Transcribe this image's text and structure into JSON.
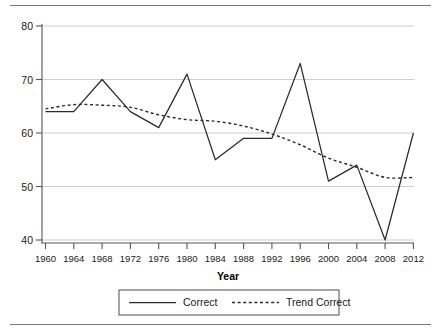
{
  "chart_data": {
    "type": "line",
    "title": "",
    "xlabel": "Year",
    "ylabel": "",
    "xlim": [
      1960,
      2012
    ],
    "ylim": [
      38.5,
      81
    ],
    "grid": true,
    "grid_axis": "y",
    "legend_position": "bottom",
    "x": [
      1960,
      1964,
      1968,
      1972,
      1976,
      1980,
      1984,
      1988,
      1992,
      1996,
      2000,
      2004,
      2008,
      2012
    ],
    "xtick_labels": [
      "1960",
      "1964",
      "1968",
      "1972",
      "1976",
      "1980",
      "1984",
      "1988",
      "1992",
      "1996",
      "2000",
      "2004",
      "2008",
      "2012"
    ],
    "ytick_labels": [
      "40",
      "50",
      "60",
      "70",
      "80"
    ],
    "yticks": [
      40,
      50,
      60,
      70,
      80
    ],
    "series": [
      {
        "name": "Correct",
        "style": "solid",
        "color": "#2b2b2b",
        "values": [
          64,
          64,
          70,
          64,
          61,
          71,
          55,
          59,
          59,
          73,
          51,
          54,
          40,
          60
        ]
      },
      {
        "name": "Trend Correct",
        "style": "dashed",
        "color": "#2b2b2b",
        "values": [
          64.5,
          65.3,
          65.2,
          64.8,
          63.4,
          62.5,
          62.2,
          61.3,
          59.8,
          57.8,
          55.3,
          53.6,
          51.7,
          51.7
        ]
      }
    ]
  },
  "axis": {
    "x_title": "Year",
    "y_tick_40": "40",
    "y_tick_50": "50",
    "y_tick_60": "60",
    "y_tick_70": "70",
    "y_tick_80": "80",
    "x_tick_1960": "1960",
    "x_tick_1964": "1964",
    "x_tick_1968": "1968",
    "x_tick_1972": "1972",
    "x_tick_1976": "1976",
    "x_tick_1980": "1980",
    "x_tick_1984": "1984",
    "x_tick_1988": "1988",
    "x_tick_1992": "1992",
    "x_tick_1996": "1996",
    "x_tick_2000": "2000",
    "x_tick_2004": "2004",
    "x_tick_2008": "2008",
    "x_tick_2012": "2012"
  },
  "legend": {
    "entries": [
      {
        "label": "Correct",
        "style": "solid"
      },
      {
        "label": "Trend Correct",
        "style": "dashed"
      }
    ],
    "label_correct": "Correct",
    "label_trend_correct": "Trend Correct"
  },
  "colors": {
    "line": "#2b2b2b",
    "grid": "#cfcfcf",
    "axis": "#555555",
    "rule": "#7a7a7a",
    "text": "#1a1a1a"
  }
}
